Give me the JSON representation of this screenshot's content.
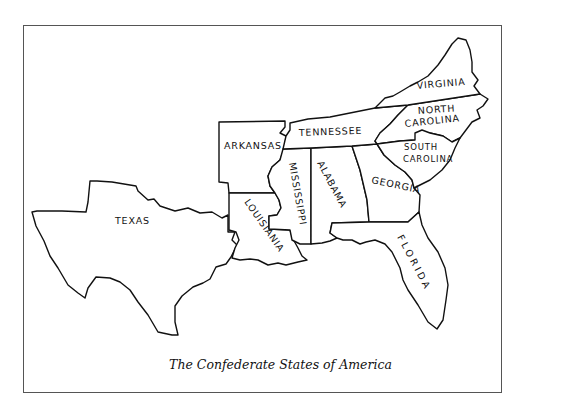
{
  "map": {
    "title": "The Confederate States of America",
    "style": {
      "stroke": "#111111",
      "fill": "#ffffff",
      "border": "#555555"
    },
    "states": [
      {
        "id": "texas",
        "label": "TEXAS"
      },
      {
        "id": "arkansas",
        "label": "ARKANSAS"
      },
      {
        "id": "louisiana",
        "label": "LOUISIANIA"
      },
      {
        "id": "mississippi",
        "label": "MISSISSIPPI"
      },
      {
        "id": "alabama",
        "label": "ALABAMA"
      },
      {
        "id": "tennessee",
        "label": "TENNESSEE"
      },
      {
        "id": "georgia",
        "label": "GEORGIA"
      },
      {
        "id": "florida",
        "label": "FLORIDA"
      },
      {
        "id": "south-carolina",
        "label_line1": "SOUTH",
        "label_line2": "CAROLINA"
      },
      {
        "id": "north-carolina",
        "label_line1": "NORTH",
        "label_line2": "CAROLINA"
      },
      {
        "id": "virginia",
        "label": "VIRGINIA"
      }
    ]
  }
}
